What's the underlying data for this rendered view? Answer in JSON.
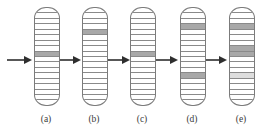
{
  "figure": {
    "type": "diagram",
    "background_color": "#ffffff",
    "line_color": "#7b7b7b",
    "band_line_color": "#8a8a8a",
    "shade_colors": {
      "dark": "#a8a8a8",
      "light": "#c9c9c9",
      "pale": "#dddddd"
    },
    "band_count": 18,
    "panels": [
      {
        "id": "a",
        "label": "(a)",
        "x": 34,
        "label_x": 26,
        "bands": [
          "plain",
          "plain",
          "plain",
          "plain",
          "plain",
          "plain",
          "plain",
          "plain",
          "shaded",
          "plain",
          "plain",
          "plain",
          "plain",
          "plain",
          "plain",
          "plain",
          "plain",
          "plain"
        ]
      },
      {
        "id": "b",
        "label": "(b)",
        "x": 82,
        "label_x": 74,
        "bands": [
          "plain",
          "plain",
          "plain",
          "plain",
          "shaded",
          "plain",
          "plain",
          "plain",
          "plain",
          "plain",
          "plain",
          "plain",
          "plain",
          "plain",
          "plain",
          "plain",
          "plain",
          "plain"
        ]
      },
      {
        "id": "c",
        "label": "(c)",
        "x": 130,
        "label_x": 122,
        "bands": [
          "plain",
          "plain",
          "plain",
          "plain",
          "plain",
          "plain",
          "plain",
          "plain",
          "shaded",
          "plain",
          "plain",
          "plain",
          "plain",
          "plain",
          "plain",
          "plain",
          "plain",
          "plain"
        ]
      },
      {
        "id": "d",
        "label": "(d)",
        "x": 180,
        "label_x": 172,
        "bands": [
          "plain",
          "plain",
          "plain",
          "shaded",
          "plain",
          "plain",
          "plain",
          "plain",
          "plain",
          "plain",
          "plain",
          "plain",
          "shaded",
          "plain",
          "plain",
          "plain",
          "plain",
          "plain"
        ]
      },
      {
        "id": "e",
        "label": "(e)",
        "x": 229,
        "label_x": 221,
        "bands": [
          "plain",
          "plain",
          "plain",
          "shaded",
          "plain",
          "plain",
          "plain",
          "shaded",
          "shaded",
          "plain",
          "plain",
          "plain",
          "shaded-pale",
          "plain",
          "plain",
          "plain",
          "plain",
          "plain"
        ]
      }
    ],
    "arrows": [
      {
        "id": "arrow-1",
        "x": 6
      },
      {
        "id": "arrow-2",
        "x": 55
      },
      {
        "id": "arrow-3",
        "x": 104
      },
      {
        "id": "arrow-4",
        "x": 152
      },
      {
        "id": "arrow-5",
        "x": 201
      }
    ]
  }
}
